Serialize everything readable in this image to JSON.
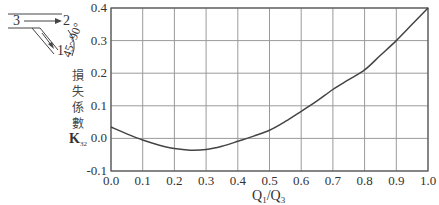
{
  "chart_data": {
    "type": "line",
    "title": "",
    "xlabel": "Q1/Q3",
    "ylabel": "損失係數 K32",
    "xlim": [
      0.0,
      1.0
    ],
    "ylim": [
      -0.1,
      0.4
    ],
    "grid": true,
    "x_ticks": [
      "0.0",
      "0.1",
      "0.2",
      "0.3",
      "0.4",
      "0.5",
      "0.6",
      "0.7",
      "0.8",
      "0.9",
      "1.0"
    ],
    "y_ticks": [
      "0.4",
      "0.3",
      "0.2",
      "0.1",
      "0.0",
      "-0.1"
    ],
    "series": [
      {
        "name": "K32",
        "x": [
          0.0,
          0.05,
          0.1,
          0.15,
          0.2,
          0.25,
          0.3,
          0.35,
          0.4,
          0.45,
          0.5,
          0.55,
          0.6,
          0.65,
          0.7,
          0.75,
          0.8,
          0.85,
          0.9,
          0.95,
          1.0
        ],
        "values": [
          0.035,
          0.014,
          -0.005,
          -0.02,
          -0.031,
          -0.036,
          -0.034,
          -0.024,
          -0.009,
          0.007,
          0.025,
          0.052,
          0.083,
          0.115,
          0.15,
          0.18,
          0.21,
          0.255,
          0.3,
          0.35,
          0.4
        ]
      }
    ],
    "annotations": [
      "3",
      "2",
      "1",
      "45~90°"
    ]
  },
  "labels": {
    "xlabel_main": "Q",
    "xlabel_sub1": "1",
    "xlabel_slash": "/Q",
    "xlabel_sub3": "3",
    "ylabel_chars": [
      "損",
      "失",
      "係",
      "數"
    ],
    "ylabel_k": "K",
    "ylabel_k_sub": "32",
    "diagram_branch_main_in": "3",
    "diagram_branch_main_out": "2",
    "diagram_branch_side": "1",
    "diagram_angle": "45~90°"
  }
}
